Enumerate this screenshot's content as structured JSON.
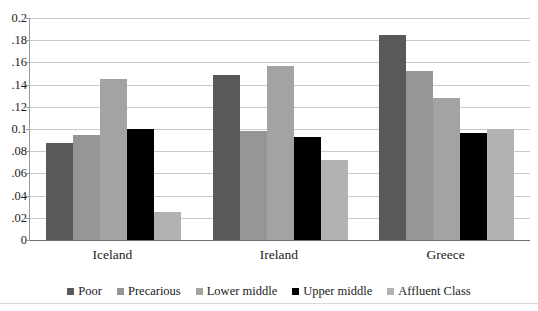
{
  "chart_data": {
    "type": "bar",
    "title": "",
    "subtitle": "",
    "xlabel": "",
    "ylabel": "",
    "categories": [
      "Iceland",
      "Ireland",
      "Greece"
    ],
    "series": [
      {
        "name": "Poor",
        "color": "#595959",
        "values": [
          0.087,
          0.149,
          0.185
        ]
      },
      {
        "name": "Precarious",
        "color": "#969696",
        "values": [
          0.095,
          0.098,
          0.152
        ]
      },
      {
        "name": "Lower middle",
        "color": "#a3a3a3",
        "values": [
          0.145,
          0.157,
          0.128
        ]
      },
      {
        "name": "Upper middle",
        "color": "#000000",
        "values": [
          0.1,
          0.093,
          0.096
        ]
      },
      {
        "name": "Affluent Class",
        "color": "#b2b2b2",
        "values": [
          0.025,
          0.072,
          0.1
        ]
      }
    ],
    "ylim": [
      0,
      0.2
    ],
    "yticks": [
      0,
      0.02,
      0.04,
      0.06,
      0.08,
      0.1,
      0.12,
      0.14,
      0.16,
      0.18,
      0.2
    ],
    "ytick_labels": [
      "0",
      ".02",
      ".04",
      ".06",
      ".08",
      "0.1",
      ".12",
      ".14",
      ".16",
      ".18",
      "0.2"
    ],
    "grid": true,
    "legend_position": "bottom",
    "annotations": []
  },
  "legend": {
    "items": [
      {
        "label": "Poor",
        "color": "#595959"
      },
      {
        "label": "Precarious",
        "color": "#969696"
      },
      {
        "label": "Lower middle",
        "color": "#a3a3a3"
      },
      {
        "label": "Upper middle",
        "color": "#000000"
      },
      {
        "label": "Affluent Class",
        "color": "#b2b2b2"
      }
    ]
  }
}
